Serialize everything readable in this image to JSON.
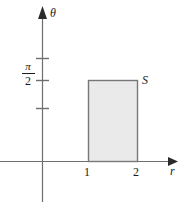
{
  "figure": {
    "background_color": "#ffffff",
    "axis_color": "#6e6e6e",
    "label_color": "#1a1a1a",
    "region_fill_color": "#eaeaea",
    "region_border_color": "#777777"
  },
  "axes": {
    "vertical": {
      "label": "θ",
      "ticks": [
        {
          "label": "",
          "value": ""
        },
        {
          "label": "π/2",
          "value": "pi/2"
        },
        {
          "label": "",
          "value": ""
        }
      ]
    },
    "horizontal": {
      "label": "r",
      "ticks": [
        {
          "label": "1",
          "value": "1"
        },
        {
          "label": "2",
          "value": "2"
        }
      ]
    }
  },
  "labels": {
    "theta_axis": "θ",
    "r_axis": "r",
    "region": "S",
    "x_tick_1": "1",
    "x_tick_2": "2",
    "pi_numerator": "π",
    "pi_denominator": "2"
  },
  "region": {
    "name": "S",
    "r_min": "1",
    "r_max": "2",
    "theta_min": "0",
    "theta_max": "π/2"
  }
}
